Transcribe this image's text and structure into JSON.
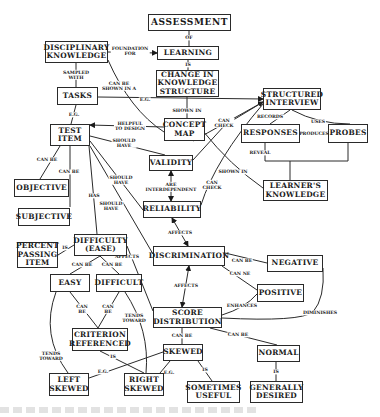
{
  "diagram": {
    "type": "concept-map",
    "title": "ASSESSMENT",
    "nodes": [
      {
        "id": "assessment",
        "label": "ASSESSMENT",
        "x": 148,
        "y": 14,
        "w": 83,
        "h": 17,
        "big": true
      },
      {
        "id": "disciplinary_knowledge",
        "label": "DISCIPLINARY\nKNOWLEDGE",
        "x": 45,
        "y": 41,
        "w": 63,
        "h": 22
      },
      {
        "id": "learning",
        "label": "LEARNING",
        "x": 157,
        "y": 46,
        "w": 62,
        "h": 14
      },
      {
        "id": "change_in_knowledge_structure",
        "label": "CHANGE IN\nKNOWLEDGE\nSTRUCTURE",
        "x": 156,
        "y": 70,
        "w": 63,
        "h": 27
      },
      {
        "id": "tasks",
        "label": "TASKS",
        "x": 57,
        "y": 87,
        "w": 41,
        "h": 18
      },
      {
        "id": "structured_interview",
        "label": "STRUCTURED\nINTERVIEW",
        "x": 263,
        "y": 88,
        "w": 58,
        "h": 22
      },
      {
        "id": "concept_map",
        "label": "CONCEPT\nMAP",
        "x": 164,
        "y": 118,
        "w": 41,
        "h": 23
      },
      {
        "id": "test_item",
        "label": "TEST\nITEM",
        "x": 50,
        "y": 124,
        "w": 40,
        "h": 22
      },
      {
        "id": "responses",
        "label": "RESPONSES",
        "x": 241,
        "y": 124,
        "w": 59,
        "h": 19
      },
      {
        "id": "probes",
        "label": "PROBES",
        "x": 328,
        "y": 124,
        "w": 40,
        "h": 19
      },
      {
        "id": "validity",
        "label": "VALIDITY",
        "x": 149,
        "y": 155,
        "w": 44,
        "h": 16
      },
      {
        "id": "learners_knowledge",
        "label": "LEARNER'S\nKNOWLEDGE",
        "x": 263,
        "y": 180,
        "w": 65,
        "h": 21
      },
      {
        "id": "objective",
        "label": "OBJECTIVE",
        "x": 14,
        "y": 179,
        "w": 55,
        "h": 18
      },
      {
        "id": "reliability",
        "label": "RELIABILITY",
        "x": 143,
        "y": 201,
        "w": 58,
        "h": 17
      },
      {
        "id": "subjective",
        "label": "SUBJECTIVE",
        "x": 18,
        "y": 208,
        "w": 52,
        "h": 18
      },
      {
        "id": "difficulty_ease",
        "label": "DIFFICULTY\n(EASE)",
        "x": 74,
        "y": 234,
        "w": 53,
        "h": 22
      },
      {
        "id": "percent_passing_item",
        "label": "PERCENT\nPASSING\nITEM",
        "x": 17,
        "y": 242,
        "w": 41,
        "h": 26
      },
      {
        "id": "discrimination",
        "label": "DISCRIMINATION",
        "x": 153,
        "y": 246,
        "w": 72,
        "h": 20
      },
      {
        "id": "negative",
        "label": "NEGATIVE",
        "x": 267,
        "y": 255,
        "w": 56,
        "h": 17
      },
      {
        "id": "easy",
        "label": "EASY",
        "x": 50,
        "y": 274,
        "w": 40,
        "h": 18
      },
      {
        "id": "difficult",
        "label": "DIFFICULT",
        "x": 96,
        "y": 274,
        "w": 46,
        "h": 18
      },
      {
        "id": "positive",
        "label": "POSITIVE",
        "x": 257,
        "y": 284,
        "w": 47,
        "h": 18
      },
      {
        "id": "score_distribution",
        "label": "SCORE\nDISTRIBUTION",
        "x": 153,
        "y": 307,
        "w": 69,
        "h": 21
      },
      {
        "id": "criterion_referenced",
        "label": "CRITERION\nREFERENCED",
        "x": 72,
        "y": 328,
        "w": 56,
        "h": 23
      },
      {
        "id": "skewed",
        "label": "SKEWED",
        "x": 163,
        "y": 344,
        "w": 40,
        "h": 17
      },
      {
        "id": "normal",
        "label": "NORMAL",
        "x": 257,
        "y": 345,
        "w": 43,
        "h": 17
      },
      {
        "id": "left_skewed",
        "label": "LEFT\nSKEWED",
        "x": 49,
        "y": 373,
        "w": 40,
        "h": 23
      },
      {
        "id": "right_skewed",
        "label": "RIGHT\nSKEWED",
        "x": 124,
        "y": 373,
        "w": 40,
        "h": 23
      },
      {
        "id": "sometimes_useful",
        "label": "SOMETIMES\nUSEFUL",
        "x": 187,
        "y": 381,
        "w": 53,
        "h": 22
      },
      {
        "id": "generally_desired",
        "label": "GENERALLY\nDESIRED",
        "x": 250,
        "y": 381,
        "w": 53,
        "h": 22
      }
    ],
    "edges": [
      {
        "from": "assessment",
        "to": "learning",
        "label": "OF",
        "path": "M189 31 L189 46",
        "lx": 189,
        "ly": 38,
        "arrow": false
      },
      {
        "from": "disciplinary_knowledge",
        "to": "learning",
        "label": "FOUNDATION\nFOR",
        "path": "M108 52 L157 53",
        "lx": 130,
        "ly": 51,
        "arrow": true
      },
      {
        "from": "learning",
        "to": "change_in_knowledge_structure",
        "label": "IS",
        "path": "M188 60 L188 70",
        "lx": 188,
        "ly": 65,
        "arrow": false
      },
      {
        "from": "disciplinary_knowledge",
        "to": "tasks",
        "label": "SAMPLED\nWITH",
        "path": "M76 63 L76 87",
        "lx": 76,
        "ly": 75,
        "arrow": false
      },
      {
        "from": "disciplinary_knowledge",
        "to": "concept_map",
        "label": "CAN BE\nSHOWN IN A",
        "path": "M108 60 Q130 110 164 132",
        "lx": 119,
        "ly": 86,
        "arrow": false
      },
      {
        "from": "change_in_knowledge_structure",
        "to": "concept_map",
        "label": "SHOWN IN",
        "path": "M187 97 L187 118",
        "lx": 187,
        "ly": 111,
        "arrow": false
      },
      {
        "from": "tasks",
        "to": "structured_interview",
        "label": "E.G.",
        "path": "M98 97 L263 99",
        "lx": 145,
        "ly": 100,
        "arrow": true
      },
      {
        "from": "tasks",
        "to": "test_item",
        "label": "E.G.",
        "path": "M76 105 L71 124",
        "lx": 74,
        "ly": 115,
        "arrow": false
      },
      {
        "from": "concept_map",
        "to": "test_item",
        "label": "HELPFUL\nTO DESIGN",
        "path": "M164 127 L90 125",
        "lx": 130,
        "ly": 126,
        "arrow": true
      },
      {
        "from": "test_item",
        "to": "validity",
        "label": "SHOULD\nHAVE",
        "path": "M90 136 L165 155",
        "lx": 124,
        "ly": 143,
        "arrow": false
      },
      {
        "from": "structured_interview",
        "to": "responses",
        "label": "RECORDS",
        "path": "M290 110 L270 124",
        "lx": 270,
        "ly": 117,
        "arrow": false
      },
      {
        "from": "structured_interview",
        "to": "probes",
        "label": "USES",
        "path": "M292 110 Q318 124 350 124",
        "lx": 318,
        "ly": 122,
        "arrow": false
      },
      {
        "from": "responses",
        "to": "probes",
        "label": "PRODUCES",
        "path": "M300 134 L328 134",
        "lx": 314,
        "ly": 134,
        "arrow": false
      },
      {
        "from": "concept_map",
        "to": "structured_interview",
        "label": "CAN\nCHECK",
        "path": "M193 141 L263 102",
        "lx": 224,
        "ly": 123,
        "arrow": true
      },
      {
        "from": "validity",
        "to": "structured_interview",
        "label": "",
        "path": "M193 160 L225 125 L263 102",
        "lx": 0,
        "ly": 0,
        "arrow": false
      },
      {
        "from": "responses",
        "to": "learners_knowledge",
        "label": "REVEAL",
        "path": "M265 143 L265 161 L290 161 L290 180 M290 161 L348 161 L348 143",
        "lx": 260,
        "ly": 153,
        "arrow": false
      },
      {
        "from": "concept_map",
        "to": "learners_knowledge",
        "label": "SHOWN IN",
        "path": "M203 131 Q230 165 263 188",
        "lx": 233,
        "ly": 172,
        "arrow": false
      },
      {
        "from": "reliability",
        "to": "structured_interview",
        "label": "CAN\nCHECK",
        "path": "M201 205 Q215 160 263 104",
        "lx": 212,
        "ly": 185,
        "arrow": false
      },
      {
        "from": "validity",
        "to": "reliability",
        "label": "ARE\nINTERDEPENDENT",
        "path": "M171 171 L171 201",
        "lx": 171,
        "ly": 187,
        "arrow": true,
        "arrowBoth": true
      },
      {
        "from": "test_item",
        "to": "objective",
        "label": "CAN BE",
        "path": "M60 146 L40 179",
        "lx": 47,
        "ly": 160,
        "arrow": false
      },
      {
        "from": "test_item",
        "to": "subjective",
        "label": "CAN BE",
        "path": "M70 146 L70 207",
        "lx": 69,
        "ly": 172,
        "arrow": false
      },
      {
        "from": "test_item",
        "to": "reliability",
        "label": "SHOULD\nHAVE",
        "path": "M90 141 L143 210",
        "lx": 121,
        "ly": 180,
        "arrow": false
      },
      {
        "from": "test_item",
        "to": "difficulty_ease",
        "label": "HAS",
        "path": "M89 146 L97 234",
        "lx": 94,
        "ly": 196,
        "arrow": false
      },
      {
        "from": "test_item",
        "to": "discrimination",
        "label": "SHOULD\nHAVE",
        "path": "M90 146 L153 254",
        "lx": 111,
        "ly": 206,
        "arrow": false
      },
      {
        "from": "reliability",
        "to": "discrimination",
        "label": "AFFECTS",
        "path": "M172 218 L188 246",
        "lx": 180,
        "ly": 233,
        "arrow": true,
        "arrowBoth": true
      },
      {
        "from": "difficulty_ease",
        "to": "percent_passing_item",
        "label": "IS",
        "path": "M74 245 L58 255",
        "lx": 65,
        "ly": 248,
        "arrow": false
      },
      {
        "from": "difficulty_ease",
        "to": "discrimination",
        "label": "AFFECTS",
        "path": "M127 246 L153 311",
        "lx": 127,
        "ly": 257,
        "arrow": false
      },
      {
        "from": "difficulty_ease",
        "to": "easy",
        "label": "CAN BE",
        "path": "M100 256 L70 274",
        "lx": 82,
        "ly": 265,
        "arrow": false
      },
      {
        "from": "difficulty_ease",
        "to": "difficult",
        "label": "CAN BE",
        "path": "M100 256 L119 274",
        "lx": 112,
        "ly": 265,
        "arrow": false
      },
      {
        "from": "discrimination",
        "to": "negative",
        "label": "CAN BE",
        "path": "M225 253 L267 263",
        "lx": 242,
        "ly": 261,
        "arrow": false
      },
      {
        "from": "discrimination",
        "to": "positive",
        "label": "CAN NE",
        "path": "M222 266 L257 290",
        "lx": 240,
        "ly": 274,
        "arrow": false
      },
      {
        "from": "score_distribution",
        "to": "discrimination",
        "label": "AFFECTS",
        "path": "M182 307 L189 266",
        "lx": 186,
        "ly": 286,
        "arrow": true,
        "arrowBoth": true
      },
      {
        "from": "score_distribution",
        "to": "positive",
        "label": "ENHANCES",
        "path": "M222 315 Q245 308 257 294",
        "lx": 242,
        "ly": 306,
        "arrow": false
      },
      {
        "from": "score_distribution",
        "to": "negative",
        "label": "DIMINISHES",
        "path": "M222 318 Q300 322 313 312 Q325 298 323 268",
        "lx": 320,
        "ly": 313,
        "arrow": false
      },
      {
        "from": "easy",
        "to": "criterion_referenced",
        "label": "CAN\nBE",
        "path": "M70 292 L98 328",
        "lx": 82,
        "ly": 309,
        "arrow": false
      },
      {
        "from": "difficult",
        "to": "criterion_referenced",
        "label": "CAN\nBE",
        "path": "M119 292 L98 328",
        "lx": 108,
        "ly": 309,
        "arrow": false
      },
      {
        "from": "difficult",
        "to": "right_skewed",
        "label": "TENDS\nTOWARD",
        "path": "M125 292 Q150 330 146 373",
        "lx": 134,
        "ly": 318,
        "arrow": false
      },
      {
        "from": "easy",
        "to": "left_skewed",
        "label": "TENDS\nTOWARD",
        "path": "M56 292 Q40 335 68 373",
        "lx": 51,
        "ly": 356,
        "arrow": false
      },
      {
        "from": "criterion_referenced",
        "to": "right_skewed",
        "label": "IS",
        "path": "M100 351 L144 373",
        "lx": 113,
        "ly": 357,
        "arrow": false
      },
      {
        "from": "score_distribution",
        "to": "skewed",
        "label": "CAN BE",
        "path": "M182 328 L182 344",
        "lx": 182,
        "ly": 336,
        "arrow": false
      },
      {
        "from": "score_distribution",
        "to": "normal",
        "label": "CAN BE",
        "path": "M210 328 L277 345",
        "lx": 238,
        "ly": 335,
        "arrow": false
      },
      {
        "from": "skewed",
        "to": "left_skewed",
        "label": "E.G.",
        "path": "M163 352 L89 378",
        "lx": 103,
        "ly": 372,
        "arrow": false
      },
      {
        "from": "skewed",
        "to": "right_skewed",
        "label": "E.G.",
        "path": "M170 361 L160 373",
        "lx": 169,
        "ly": 373,
        "arrow": false
      },
      {
        "from": "skewed",
        "to": "sometimes_useful",
        "label": "IS",
        "path": "M198 361 L212 381",
        "lx": 205,
        "ly": 370,
        "arrow": false
      },
      {
        "from": "normal",
        "to": "generally_desired",
        "label": "IS",
        "path": "M276 362 L276 381",
        "lx": 276,
        "ly": 372,
        "arrow": false
      }
    ]
  },
  "colors": {
    "background": "#ffffff",
    "stroke": "#2a2a2a",
    "text": "#1a1a1a"
  }
}
